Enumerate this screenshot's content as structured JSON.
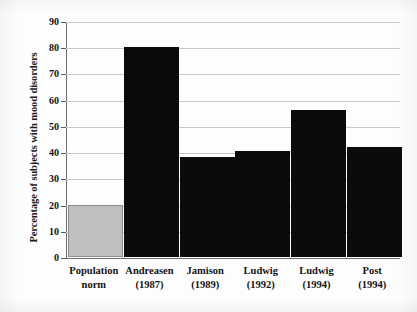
{
  "chart_data": {
    "type": "bar",
    "title": "",
    "xlabel": "",
    "ylabel": "Percentage of subjects with mood disorders",
    "ylim": [
      0,
      90
    ],
    "ytick_step": 10,
    "yticks": [
      90,
      80,
      70,
      60,
      50,
      40,
      30,
      20,
      10,
      0
    ],
    "grid": true,
    "legend": "none",
    "categories": [
      {
        "line1": "Population",
        "line2": "norm"
      },
      {
        "line1": "Andreasen",
        "line2": "(1987)"
      },
      {
        "line1": "Jamison",
        "line2": "(1989)"
      },
      {
        "line1": "Ludwig",
        "line2": "(1992)"
      },
      {
        "line1": "Ludwig",
        "line2": "(1994)"
      },
      {
        "line1": "Post",
        "line2": "(1994)"
      }
    ],
    "values": [
      20,
      80,
      38,
      40.5,
      56,
      42
    ],
    "bar_colors": [
      "#bfbfbf",
      "#0b0b0b",
      "#0b0b0b",
      "#0b0b0b",
      "#0b0b0b",
      "#0b0b0b"
    ],
    "colors": {
      "bar_dark": "#0b0b0b",
      "bar_light": "#bfbfbf",
      "gridline": "#c9c9c9",
      "axis": "#6e6e6e",
      "text": "#141414",
      "background": "#fdfdfd"
    }
  }
}
